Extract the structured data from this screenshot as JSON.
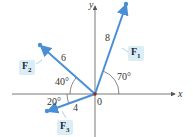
{
  "diagram": {
    "axes": {
      "x_label": "x",
      "y_label": "y",
      "origin_label": "0"
    },
    "vectors": [
      {
        "name": "F",
        "sub": "1",
        "magnitude": "8",
        "angle_label": "70°"
      },
      {
        "name": "F",
        "sub": "2",
        "magnitude": "6",
        "angle_label": "40°"
      },
      {
        "name": "F",
        "sub": "3",
        "magnitude": "4",
        "angle_label": "20°"
      }
    ],
    "colors": {
      "vector": "#4a8fd6",
      "axis": "#555555",
      "label_bg": "#dbeef6",
      "origin": "#8b2a2a"
    }
  }
}
